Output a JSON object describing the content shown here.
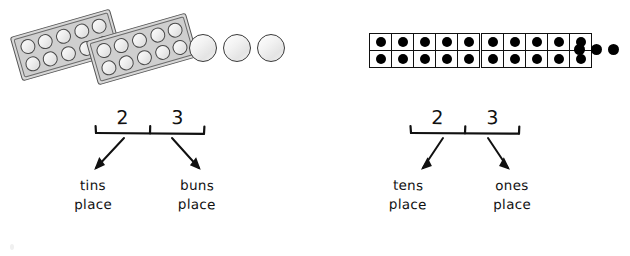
{
  "page": {
    "background_color": "#ffffff",
    "width": 630,
    "height": 256
  },
  "panels": [
    {
      "id": "concrete",
      "manipulative_type": "muffin-tin",
      "number_represented": "23",
      "groups": {
        "full_tins": 2,
        "buns_per_tin": 10,
        "loose_buns": 3
      },
      "place_value": {
        "tens_digit": "2",
        "ones_digit": "3",
        "tens_label_line1": "tins",
        "tens_label_line2": "place",
        "ones_label_line1": "buns",
        "ones_label_line2": "place"
      }
    },
    {
      "id": "abstract",
      "manipulative_type": "ten-frame",
      "number_represented": "23",
      "groups": {
        "full_frames": 2,
        "dots_per_frame": 10,
        "loose_dots": 3
      },
      "place_value": {
        "tens_digit": "2",
        "ones_digit": "3",
        "tens_label_line1": "tens",
        "tens_label_line2": "place",
        "ones_label_line1": "ones",
        "ones_label_line2": "place"
      }
    }
  ],
  "colors": {
    "ink": "#111111",
    "dot_fill": "#000000",
    "tin_frame": "#555555",
    "tin_body": "#d8d8d8",
    "bun_outline": "#4a4a4a"
  }
}
